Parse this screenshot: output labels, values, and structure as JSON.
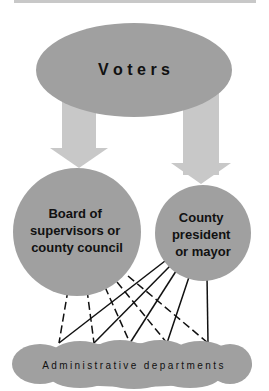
{
  "diagram": {
    "top_node": {
      "label": "V o t e r s",
      "shape": "ellipse"
    },
    "left_node": {
      "lines": [
        "Board of",
        "supervisors or",
        "county council"
      ],
      "shape": "circle"
    },
    "right_node": {
      "lines": [
        "County",
        "president",
        "or mayor"
      ],
      "shape": "circle"
    },
    "bottom_node": {
      "label": "Administrative departments",
      "shape": "cloud"
    },
    "edges": [
      {
        "from": "Voters",
        "to": "Board of supervisors or county council",
        "style": "arrow"
      },
      {
        "from": "Voters",
        "to": "County president or mayor",
        "style": "arrow"
      },
      {
        "from": "Board of supervisors or county council",
        "to": "Administrative departments",
        "style": "dashed",
        "count": 5
      },
      {
        "from": "County president or mayor",
        "to": "Administrative departments",
        "style": "solid",
        "count": 5
      }
    ],
    "colors": {
      "node_fill": "#a0a0a0",
      "arrow_fill": "#c8c8c8",
      "line": "#111111"
    }
  }
}
